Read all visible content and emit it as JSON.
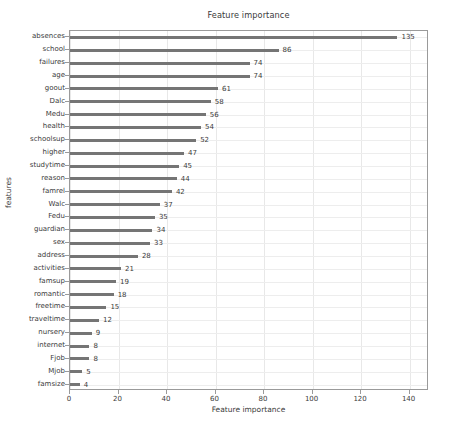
{
  "chart_data": {
    "type": "bar",
    "orientation": "horizontal",
    "title": "Feature importance",
    "xlabel": "Feature importance",
    "ylabel": "features",
    "categories": [
      "absences",
      "school",
      "failures",
      "age",
      "goout",
      "Dalc",
      "Medu",
      "health",
      "schoolsup",
      "higher",
      "studytime",
      "reason",
      "famrel",
      "Walc",
      "Fedu",
      "guardian",
      "sex",
      "address",
      "activities",
      "famsup",
      "romantic",
      "freetime",
      "traveltime",
      "nursery",
      "internet",
      "Fjob",
      "Mjob",
      "famsize"
    ],
    "values": [
      135,
      86,
      74,
      74,
      61,
      58,
      56,
      54,
      52,
      47,
      45,
      44,
      42,
      37,
      35,
      34,
      33,
      28,
      21,
      19,
      18,
      15,
      12,
      9,
      8,
      8,
      5,
      4
    ],
    "xlim": [
      0,
      148
    ],
    "xticks": [
      0,
      20,
      40,
      60,
      80,
      100,
      120,
      140
    ],
    "xtick_labels": [
      "0",
      "20",
      "40",
      "60",
      "80",
      "100",
      "120",
      "140"
    ],
    "grid": true,
    "legend": null,
    "bar_color": "#757575",
    "grid_color": "#e8e8e8",
    "axis_color": "#9a9a9a",
    "text_color": "#3b3b3b"
  }
}
